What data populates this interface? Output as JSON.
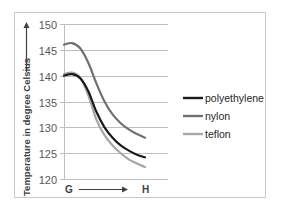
{
  "chart_data": {
    "type": "line",
    "title": "",
    "xlabel": "G → H",
    "ylabel": "Temperature in degree Celsius",
    "ylim": [
      120,
      150
    ],
    "yticks": [
      "150",
      "145",
      "140",
      "135",
      "130",
      "125",
      "120"
    ],
    "x_start_label": "G",
    "x_end_label": "H",
    "grid": true,
    "legend_position": "right",
    "x": [
      0,
      0.1,
      0.2,
      0.3,
      0.4,
      0.5,
      0.6,
      0.7,
      0.8,
      0.9,
      1.0
    ],
    "series": [
      {
        "name": "polyethylene",
        "color": "#1a1a1a",
        "values": [
          140,
          140.3,
          139.5,
          137,
          133,
          130,
          128,
          126.5,
          125.5,
          124.7,
          124.2
        ]
      },
      {
        "name": "nylon",
        "color": "#707070",
        "values": [
          146,
          146.3,
          145.3,
          142.5,
          138.5,
          135,
          132.5,
          130.8,
          129.6,
          128.7,
          128
        ]
      },
      {
        "name": "teflon",
        "color": "#a6a6a6",
        "values": [
          140.3,
          140.6,
          139.6,
          136.2,
          131.5,
          128.5,
          126.5,
          125,
          123.8,
          123,
          122.3
        ]
      }
    ]
  },
  "legend": {
    "items": [
      {
        "label": "polyethylene",
        "color": "#1a1a1a"
      },
      {
        "label": "nylon",
        "color": "#707070"
      },
      {
        "label": "teflon",
        "color": "#a6a6a6"
      }
    ]
  },
  "axis": {
    "y_title": "Temperature in degree Celsius",
    "x_start": "G",
    "x_end": "H"
  }
}
